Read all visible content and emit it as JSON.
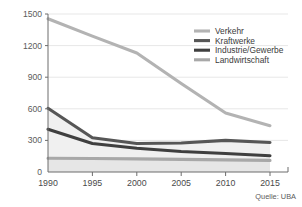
{
  "title": "",
  "source": "Quelle: UBA",
  "axis": {
    "y_ticks": [
      "0",
      "300",
      "600",
      "900",
      "1200",
      "1500"
    ],
    "x_ticks": [
      "1990",
      "1995",
      "2000",
      "2005",
      "2010",
      "2015"
    ]
  },
  "legend": {
    "items": [
      {
        "label": "Verkehr",
        "color": "#b3b3b3"
      },
      {
        "label": "Kraftwerke",
        "color": "#565656"
      },
      {
        "label": "Industrie/Gewerbe",
        "color": "#3f3f3f"
      },
      {
        "label": "Landwirtschaft",
        "color": "#a8a8a8"
      }
    ]
  },
  "chart_data": {
    "type": "line",
    "title": "",
    "xlabel": "",
    "ylabel": "",
    "x": [
      1990,
      1995,
      2000,
      2005,
      2010,
      2015
    ],
    "xlim": [
      1990,
      2015
    ],
    "ylim": [
      0,
      1500
    ],
    "grid": true,
    "legend_position": "top-right",
    "source": "Quelle: UBA",
    "series": [
      {
        "name": "Verkehr",
        "color": "#b3b3b3",
        "values": [
          1455,
          1290,
          1130,
          840,
          560,
          440
        ]
      },
      {
        "name": "Kraftwerke",
        "color": "#565656",
        "values": [
          605,
          325,
          270,
          275,
          300,
          280
        ]
      },
      {
        "name": "Industrie/Gewerbe",
        "color": "#3f3f3f",
        "values": [
          405,
          270,
          225,
          195,
          175,
          155
        ]
      },
      {
        "name": "Landwirtschaft",
        "color": "#a8a8a8",
        "values": [
          130,
          128,
          125,
          120,
          115,
          110
        ]
      }
    ]
  }
}
